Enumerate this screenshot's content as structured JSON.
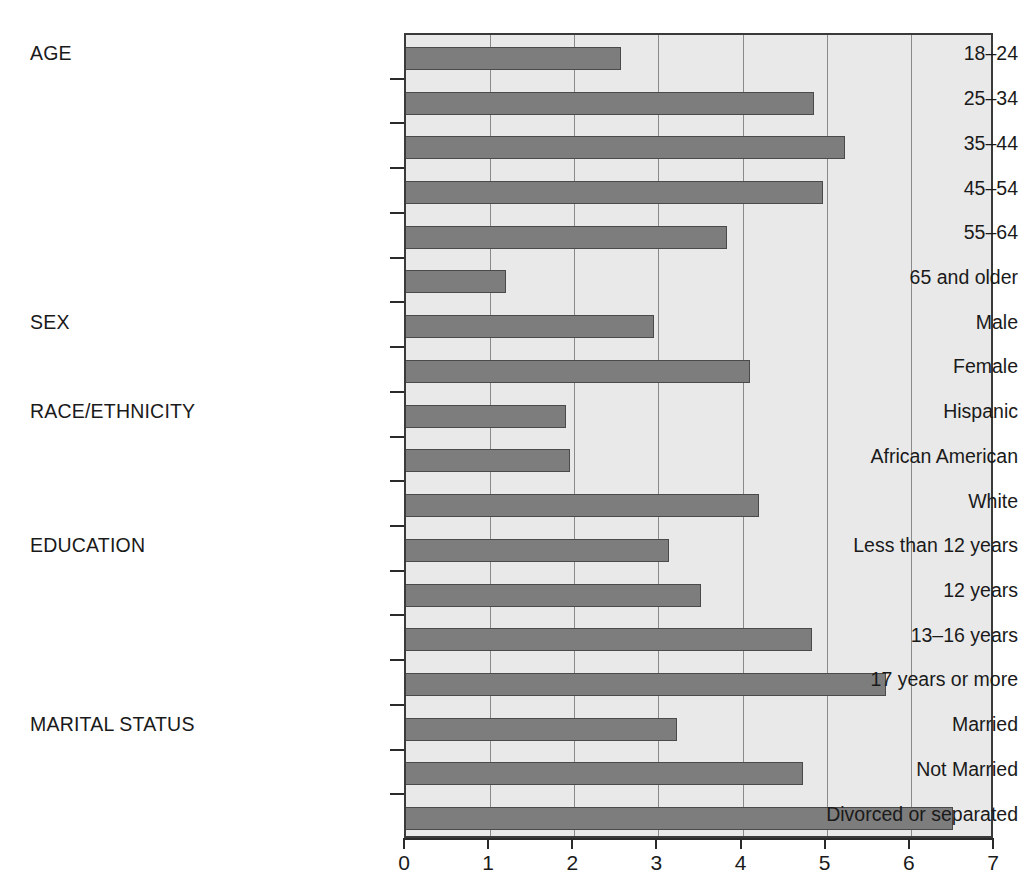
{
  "chart_data": {
    "type": "bar",
    "orientation": "horizontal",
    "title": "",
    "xlabel": "",
    "ylabel": "",
    "xlim": [
      0,
      7
    ],
    "xticks": [
      "0",
      "1",
      "2",
      "3",
      "4",
      "5",
      "6",
      "7"
    ],
    "grid": "vertical",
    "legend": "none",
    "bar_color": "#7d7d7d",
    "bar_edge_color": "#4a4a4a",
    "plot_background": "#e9e9e9",
    "groups": [
      {
        "name": "AGE",
        "row_index": 0,
        "categories": [
          "18–24",
          "25–34",
          "35–44",
          "45–54",
          "55–64",
          "65 and older"
        ],
        "values": [
          2.55,
          4.85,
          5.22,
          4.95,
          3.81,
          1.19
        ]
      },
      {
        "name": "SEX",
        "row_index": 6,
        "categories": [
          "Male",
          "Female"
        ],
        "values": [
          2.95,
          4.09
        ]
      },
      {
        "name": "RACE/ETHNICITY",
        "row_index": 8,
        "categories": [
          "Hispanic",
          "African American",
          "White"
        ],
        "values": [
          1.9,
          1.95,
          4.2
        ]
      },
      {
        "name": "EDUCATION",
        "row_index": 11,
        "categories": [
          "Less than 12 years",
          "12 years",
          "13–16 years",
          "17 years or more"
        ],
        "values": [
          3.12,
          3.5,
          4.82,
          5.7
        ]
      },
      {
        "name": "MARITAL STATUS",
        "row_index": 15,
        "categories": [
          "Married",
          "Not Married",
          "Divorced or separated"
        ],
        "values": [
          3.22,
          4.72,
          6.5
        ]
      }
    ],
    "categories": [
      "18–24",
      "25–34",
      "35–44",
      "45–54",
      "55–64",
      "65 and older",
      "Male",
      "Female",
      "Hispanic",
      "African American",
      "White",
      "Less than 12 years",
      "12 years",
      "13–16 years",
      "17 years or more",
      "Married",
      "Not Married",
      "Divorced or separated"
    ],
    "values": [
      2.55,
      4.85,
      5.22,
      4.95,
      3.81,
      1.19,
      2.95,
      4.09,
      1.9,
      1.95,
      4.2,
      3.12,
      3.5,
      4.82,
      5.7,
      3.22,
      4.72,
      6.5
    ]
  }
}
